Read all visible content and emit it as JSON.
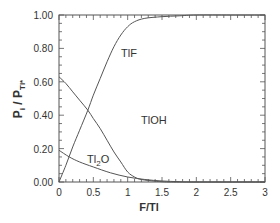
{
  "chart_data": {
    "type": "line",
    "title": "",
    "xlabel": "F/Tl",
    "ylabel": "P_i / P_Tl*",
    "xlim": [
      0,
      3
    ],
    "ylim": [
      0,
      1
    ],
    "x_ticks": [
      "0",
      "0.5",
      "1",
      "1.5",
      "2",
      "2.5",
      "3"
    ],
    "y_ticks": [
      "0.00",
      "0.20",
      "0.40",
      "0.60",
      "0.80",
      "1.00"
    ],
    "grid": false,
    "legend": "inline labels",
    "series": [
      {
        "name": "TlF",
        "label_pos": [
          0.9,
          0.8
        ],
        "x": [
          0,
          0.1,
          0.2,
          0.3,
          0.42,
          0.5,
          0.6,
          0.7,
          0.8,
          0.9,
          1.0,
          1.1,
          1.25,
          1.5,
          1.75,
          2.0,
          2.5,
          3.0
        ],
        "y": [
          0,
          0.1,
          0.21,
          0.31,
          0.43,
          0.52,
          0.62,
          0.72,
          0.81,
          0.88,
          0.93,
          0.96,
          0.98,
          0.99,
          0.995,
          1.0,
          1.0,
          1.0
        ]
      },
      {
        "name": "TlOH",
        "label_pos": [
          1.05,
          0.37
        ],
        "x": [
          0,
          0.1,
          0.2,
          0.3,
          0.42,
          0.5,
          0.6,
          0.7,
          0.8,
          0.9,
          1.0,
          1.1,
          1.2,
          1.4,
          1.6,
          2.0,
          3.0
        ],
        "y": [
          0.63,
          0.59,
          0.54,
          0.49,
          0.43,
          0.38,
          0.32,
          0.25,
          0.18,
          0.12,
          0.06,
          0.03,
          0.015,
          0.005,
          0.0,
          0.0,
          0.0
        ]
      },
      {
        "name": "Tl2O",
        "label_pos": [
          0.5,
          0.14
        ],
        "x": [
          0,
          0.15,
          0.3,
          0.5,
          0.75,
          1.0,
          1.25,
          1.5,
          1.75,
          2.0,
          3.0
        ],
        "y": [
          0.19,
          0.15,
          0.12,
          0.09,
          0.055,
          0.03,
          0.015,
          0.006,
          0.002,
          0.0,
          0.0
        ]
      }
    ]
  },
  "labels": {
    "ylabel_main": "P",
    "ylabel_sub_i": "i",
    "ylabel_slash": " / P",
    "ylabel_sub_tl": "Tl*",
    "xlabel": "F/Tl",
    "tlf": "TlF",
    "tloh": "TlOH",
    "tl2o_a": "Tl",
    "tl2o_sub": "2",
    "tl2o_b": "O"
  }
}
